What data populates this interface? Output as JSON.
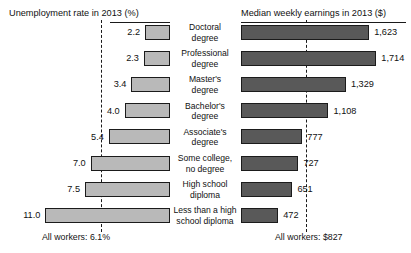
{
  "chart_data": {
    "type": "bar",
    "orientation": "horizontal",
    "layout": "back-to-back paired bar chart",
    "categories": [
      "Doctoral degree",
      "Professional degree",
      "Master's degree",
      "Bachelor's degree",
      "Associate's degree",
      "Some college, no degree",
      "High school diploma",
      "Less than a high school diploma"
    ],
    "category_lines": [
      [
        "Doctoral",
        "degree"
      ],
      [
        "Professional",
        "degree"
      ],
      [
        "Master's",
        "degree"
      ],
      [
        "Bachelor's",
        "degree"
      ],
      [
        "Associate's",
        "degree"
      ],
      [
        "Some college,",
        "no degree"
      ],
      [
        "High school",
        "diploma"
      ],
      [
        "Less than a high",
        "school diploma"
      ]
    ],
    "series": [
      {
        "name": "Unemployment rate in 2013 (%)",
        "side": "left",
        "unit": "%",
        "values": [
          2.2,
          2.3,
          3.4,
          4.0,
          5.4,
          7.0,
          7.5,
          11.0
        ],
        "labels": [
          "2.2",
          "2.3",
          "3.4",
          "4.0",
          "5.4",
          "7.0",
          "7.5",
          "11.0"
        ],
        "reference_line": 6.1,
        "reference_label": "All workers: 6.1%",
        "axis_max": 12.0,
        "color": "#b9b9b9"
      },
      {
        "name": "Median weekly earnings in 2013 ($)",
        "side": "right",
        "unit": "$",
        "values": [
          1623,
          1714,
          1329,
          1108,
          777,
          727,
          651,
          472
        ],
        "labels": [
          "1,623",
          "1,714",
          "1,329",
          "1,108",
          "777",
          "727",
          "651",
          "472"
        ],
        "reference_line": 827,
        "reference_label": "All workers: $827",
        "axis_max": 1900,
        "color": "#595959"
      }
    ],
    "grid": false,
    "legend": "none",
    "title": "",
    "xlabel": "",
    "ylabel": ""
  },
  "headers": {
    "left": "Unemployment rate in 2013 (%)",
    "right": "Median weekly earnings in 2013 ($)"
  },
  "footers": {
    "left": "All workers: 6.1%",
    "right": "All workers: $827"
  },
  "colors": {
    "left_bar_fill": "#b9b9b9",
    "right_bar_fill": "#595959",
    "bar_stroke": "#1b1b1b",
    "dashed_line": "#1a1a1a",
    "background": "#ffffff",
    "text": "#111111"
  }
}
